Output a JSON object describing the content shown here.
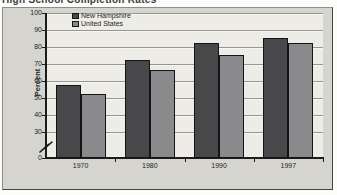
{
  "title": {
    "text": "High School Completion Rates"
  },
  "chart_data": {
    "type": "bar",
    "title": "High School Completion Rates",
    "categories": [
      "1970",
      "1980",
      "1990",
      "1997"
    ],
    "series": [
      {
        "name": "New Hampshire",
        "values": [
          57.5,
          72.5,
          82.5,
          85.5
        ]
      },
      {
        "name": "United States",
        "values": [
          52.5,
          66.5,
          75.5,
          82.5
        ]
      }
    ],
    "xlabel": "",
    "ylabel": "Percent",
    "ylim": [
      0,
      100
    ],
    "yticks": [
      0,
      30,
      40,
      50,
      60,
      70,
      80,
      90,
      100
    ],
    "axis_break_between": [
      0,
      30
    ],
    "grid": true,
    "legend_position": "top-left",
    "colors": {
      "New Hampshire": "#48484b",
      "United States": "#8a8a8c"
    },
    "plot_background": "#edece7",
    "frame_background": "#d5d4cf"
  }
}
